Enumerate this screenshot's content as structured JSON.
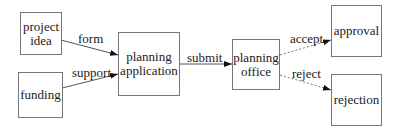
{
  "diagram": {
    "type": "flowchart",
    "nodes": [
      {
        "id": "project_idea",
        "label": "project idea",
        "lines": [
          "project",
          "idea"
        ]
      },
      {
        "id": "funding",
        "label": "funding",
        "lines": [
          "funding"
        ]
      },
      {
        "id": "planning_application",
        "label": "planning application",
        "lines": [
          "planning",
          "application"
        ]
      },
      {
        "id": "planning_office",
        "label": "planning office",
        "lines": [
          "planning",
          "office"
        ]
      },
      {
        "id": "approval",
        "label": "approval",
        "lines": [
          "approval"
        ]
      },
      {
        "id": "rejection",
        "label": "rejection",
        "lines": [
          "rejection"
        ]
      }
    ],
    "edges": [
      {
        "from": "project_idea",
        "to": "planning_application",
        "label": "form",
        "style": "solid"
      },
      {
        "from": "funding",
        "to": "planning_application",
        "label": "support",
        "style": "solid"
      },
      {
        "from": "planning_application",
        "to": "planning_office",
        "label": "submit",
        "style": "solid"
      },
      {
        "from": "planning_office",
        "to": "approval",
        "label": "accept",
        "style": "dashed"
      },
      {
        "from": "planning_office",
        "to": "rejection",
        "label": "reject",
        "style": "dashed"
      }
    ]
  }
}
